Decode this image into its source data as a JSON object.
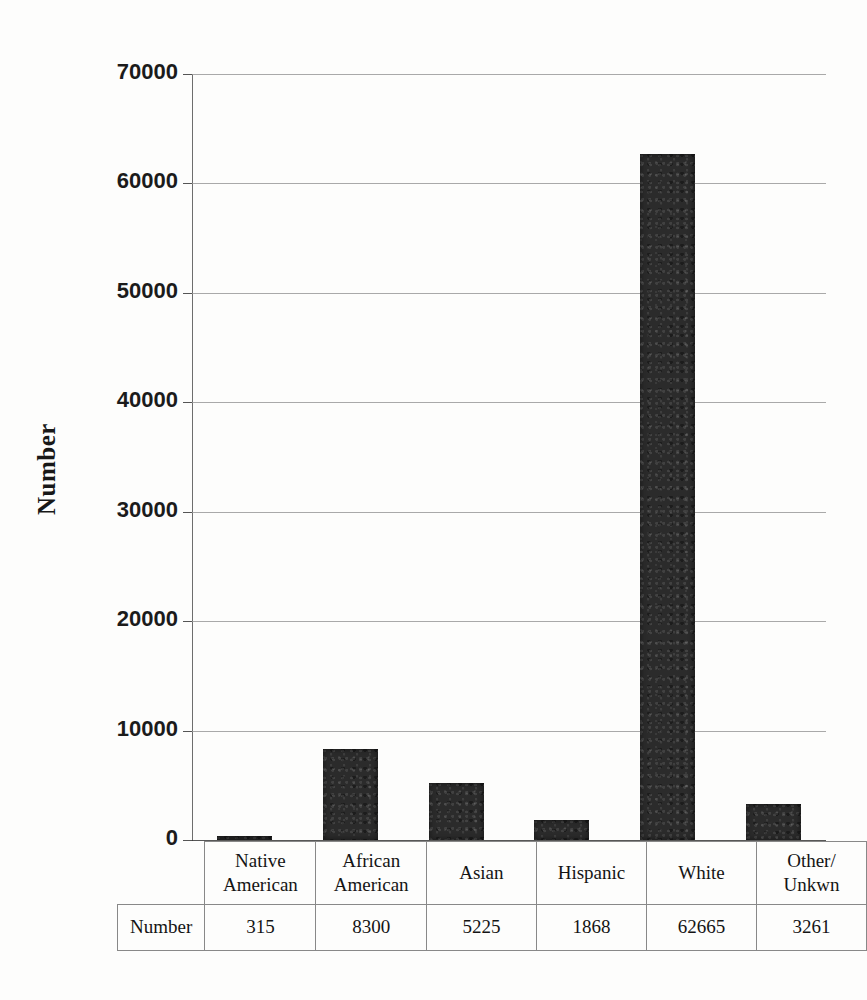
{
  "chart_data": {
    "type": "bar",
    "title": "",
    "xlabel": "",
    "ylabel": "Number",
    "categories": [
      "Native American",
      "African American",
      "Asian",
      "Hispanic",
      "White",
      "Other/ Unkwn"
    ],
    "category_lines": [
      [
        "Native",
        "American"
      ],
      [
        "African",
        "American"
      ],
      [
        "Asian"
      ],
      [
        "Hispanic"
      ],
      [
        "White"
      ],
      [
        "Other/",
        "Unkwn"
      ]
    ],
    "values": [
      315,
      8300,
      5225,
      1868,
      62665,
      3261
    ],
    "value_labels": [
      "315",
      "8300",
      "5225",
      "1868",
      "62665",
      "3261"
    ],
    "series_name": "Number",
    "table_row_label": "Number",
    "ylim": [
      0,
      70000
    ],
    "ytick_labels": [
      "0",
      "10000",
      "20000",
      "30000",
      "40000",
      "50000",
      "60000",
      "70000"
    ],
    "ytick_values": [
      0,
      10000,
      20000,
      30000,
      40000,
      50000,
      60000,
      70000
    ],
    "grid": true,
    "legend": "none",
    "bar_color": "#2b2b2b",
    "gridline_color": "#9a9a9a",
    "background_color": "#fdfdfc"
  }
}
